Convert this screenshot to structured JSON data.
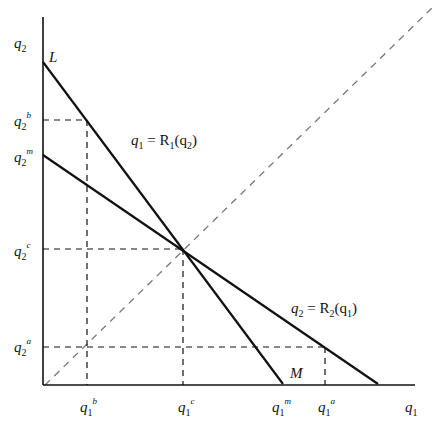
{
  "diagram": {
    "axes": {
      "y_label": {
        "base": "q",
        "sub": "2"
      },
      "x_label": {
        "base": "q",
        "sub": "1"
      }
    },
    "points": {
      "L": "L",
      "M": "M"
    },
    "curves": [
      {
        "name": "R1",
        "label_lhs": "q",
        "label_lhs_sub": "1",
        "label_eq": " = R",
        "label_R_sub": "1",
        "label_arg": "(q",
        "label_arg_sub": "2",
        "label_close": ")"
      },
      {
        "name": "R2",
        "label_lhs": "q",
        "label_lhs_sub": "2",
        "label_eq": " = R",
        "label_R_sub": "2",
        "label_arg": "(q",
        "label_arg_sub": "1",
        "label_close": ")"
      }
    ],
    "y_ticks": [
      {
        "base": "q",
        "sub": "2",
        "sup": "b"
      },
      {
        "base": "q",
        "sub": "2",
        "sup": "m"
      },
      {
        "base": "q",
        "sub": "2",
        "sup": "c"
      },
      {
        "base": "q",
        "sub": "2",
        "sup": "a"
      }
    ],
    "x_ticks": [
      {
        "base": "q",
        "sub": "1",
        "sup": "b"
      },
      {
        "base": "q",
        "sub": "1",
        "sup": "c"
      },
      {
        "base": "q",
        "sub": "1",
        "sup": "m"
      },
      {
        "base": "q",
        "sub": "1",
        "sup": "a"
      }
    ],
    "colors": {
      "line": "#111111",
      "dashed": "#111111",
      "diagonal": "#666666"
    }
  }
}
